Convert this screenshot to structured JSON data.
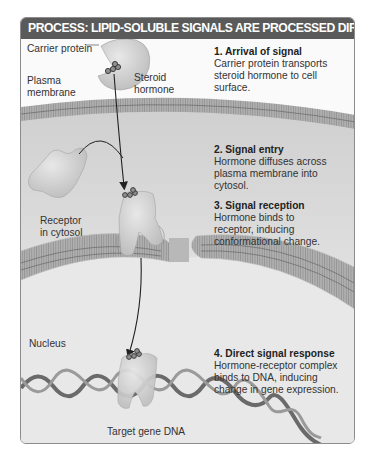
{
  "title": "PROCESS: LIPID-SOLUBLE SIGNALS ARE PROCESSED DIRECTLY",
  "labels": {
    "carrier_protein": "Carrier protein",
    "steroid_hormone": "Steroid\nhormone",
    "plasma_membrane": "Plasma\nmembrane",
    "receptor_in_cytosol": "Receptor\nin cytosol",
    "nucleus": "Nucleus",
    "target_gene_dna": "Target gene DNA"
  },
  "steps": [
    {
      "heading": "1. Arrival of signal",
      "body": "Carrier protein transports\nsteroid hormone to cell\nsurface."
    },
    {
      "heading": "2. Signal entry",
      "body": "Hormone diffuses across\nplasma membrane into\ncytosol."
    },
    {
      "heading": "3. Signal reception",
      "body": "Hormone binds to\nreceptor, inducing\nconformational change."
    },
    {
      "heading": "4. Direct signal response",
      "body": "Hormone-receptor complex\nbinds to DNA, inducing\nchange in gene expression."
    }
  ],
  "colors": {
    "header_bg": "#5a5a5a",
    "header_text": "#ffffff",
    "cytosol": "#d9d9d9",
    "membrane": "#9a9a9a",
    "nucleus": "#e6e6e6",
    "protein": "#cfcfcf"
  }
}
